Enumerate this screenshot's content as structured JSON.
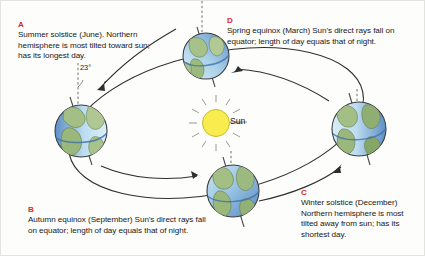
{
  "figure": {
    "sun_label": "Sun",
    "tilt_label": "23°",
    "colors": {
      "key_red": "#d9262c",
      "sun_yellow": "#f8ec4e",
      "sun_ray": "#9a9a93",
      "ocean_blue": "#6c9fd2",
      "ocean_light": "#cfe6f2",
      "land_green": "#9cb97f",
      "orbit_line": "#3a3a3a",
      "text": "#17171a",
      "background": "#fdfdfc"
    }
  },
  "captions": [
    {
      "id": "A",
      "position": "left-top",
      "key": "A",
      "text": "Summer solstice (June). Northern hemisphere is most tilted toward sun; has its longest day."
    },
    {
      "id": "D",
      "position": "right-top",
      "key": "D",
      "text": "Spring equinox (March) Sun's direct rays fall on equator; length of day equals that of night."
    },
    {
      "id": "B",
      "position": "left-bottom",
      "key": "B",
      "text": "Autumn equinox (September) Sun's direct rays fall on equator; length of day equals that of night."
    },
    {
      "id": "C",
      "position": "right-bottom",
      "key": "C",
      "text": "Winter solstice (December) Northern hemisphere is most tilted away from sun; has its shortest day."
    }
  ],
  "globes": [
    {
      "id": "summer-solstice",
      "label": "A",
      "cx": 80,
      "cy": 130,
      "r": 26,
      "lit_side": "right",
      "axis_tilt_deg": 23
    },
    {
      "id": "spring-equinox",
      "label": "D",
      "cx": 205,
      "cy": 55,
      "r": 23,
      "lit_side": "bottom-left",
      "axis_tilt_deg": 23
    },
    {
      "id": "winter-solstice",
      "label": "C",
      "cx": 358,
      "cy": 128,
      "r": 27,
      "lit_side": "left",
      "axis_tilt_deg": 23
    },
    {
      "id": "autumn-equinox",
      "label": "B",
      "cx": 232,
      "cy": 190,
      "r": 26,
      "lit_side": "top-left",
      "axis_tilt_deg": 23
    }
  ],
  "sun": {
    "cx": 215,
    "cy": 122,
    "r": 14,
    "rays": 12
  },
  "orbit": {
    "cx": 215,
    "cy": 122,
    "rx": 150,
    "ry": 70,
    "rotation_deg": -12,
    "direction": "counterclockwise"
  }
}
